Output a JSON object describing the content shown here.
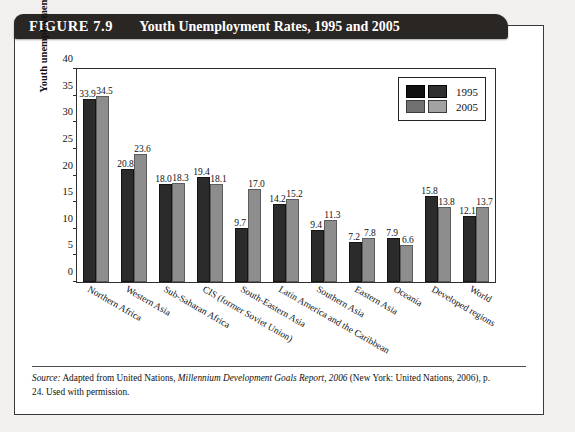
{
  "figure": {
    "number": "FIGURE 7.9",
    "title": "Youth Unemployment Rates, 1995 and 2005"
  },
  "source": {
    "label": "Source:",
    "text_1": " Adapted from United Nations, ",
    "italic_work": "Millennium Development Goals Report, 2006",
    "text_2": " (New York: United Nations, 2006), p. 24. Used with permission."
  },
  "chart_data": {
    "type": "bar",
    "title": "Youth Unemployment Rates, 1995 and 2005",
    "xlabel": "",
    "ylabel": "Youth unemployment rate (%)",
    "ylim": [
      0,
      40
    ],
    "yticks": [
      0,
      5,
      10,
      15,
      20,
      25,
      30,
      35,
      40
    ],
    "ytick_labels": [
      "0",
      "5",
      "10",
      "15",
      "20",
      "25",
      "30",
      "35",
      "40"
    ],
    "grid": false,
    "legend_position": "top-right",
    "categories": [
      "Northern Africa",
      "Western Asia",
      "Sub-Saharan Africa",
      "CIS (former Soviet Union)",
      "South-Eastern Asia",
      "Latin America and the Caribbean",
      "Southern Asia",
      "Eastern Asia",
      "Oceania",
      "Developed regions",
      "World"
    ],
    "series": [
      {
        "name": "1995",
        "color": "#2b2b2b",
        "values": [
          33.9,
          20.8,
          18.0,
          19.4,
          9.7,
          14.2,
          9.4,
          7.2,
          7.9,
          15.8,
          12.1
        ],
        "value_labels": [
          "33.9",
          "20.8",
          "18.0",
          "19.4",
          "9.7",
          "14.2",
          "9.4",
          "7.2",
          "7.9",
          "15.8",
          "12.1"
        ]
      },
      {
        "name": "2005",
        "color": "#8d8d8d",
        "values": [
          34.5,
          23.6,
          18.3,
          18.1,
          17.0,
          15.2,
          11.3,
          7.8,
          6.6,
          13.8,
          13.7
        ],
        "value_labels": [
          "34.5",
          "23.6",
          "18.3",
          "18.1",
          "17.0",
          "15.2",
          "11.3",
          "7.8",
          "6.6",
          "13.8",
          "13.7"
        ]
      }
    ]
  }
}
